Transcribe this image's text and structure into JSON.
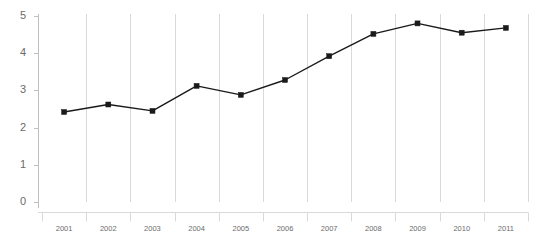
{
  "chart_data": {
    "type": "line",
    "title": "",
    "subtitle": "",
    "xlabel": "",
    "ylabel": "",
    "categories": [
      "2001",
      "2002",
      "2003",
      "2004",
      "2005",
      "2006",
      "2007",
      "2008",
      "2009",
      "2010",
      "2011"
    ],
    "series": [
      {
        "name": "",
        "values": [
          2.42,
          2.62,
          2.45,
          3.12,
          2.88,
          3.28,
          3.92,
          4.52,
          4.8,
          4.55,
          4.68
        ]
      }
    ],
    "ylim": [
      0,
      5
    ],
    "y_ticks": [
      "0",
      "1",
      "2",
      "3",
      "4",
      "5"
    ],
    "grid": "vertical",
    "legend": "none",
    "line_color": "#1a1a1a",
    "marker": "square",
    "marker_color": "#1a1a1a",
    "gridline_color": "#d9d9d9",
    "axis_color": "#bfbfbf",
    "label_color": "#6b6b6b",
    "background": "#ffffff"
  }
}
